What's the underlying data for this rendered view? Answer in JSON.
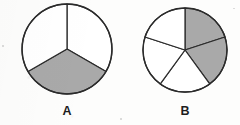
{
  "figure": {
    "title": "",
    "background_color": "#fdfdfc",
    "stroke_color": "#2b2b2b",
    "shaded_color": "#a9a9a9",
    "unshaded_color": "#ffffff",
    "label_color": "#1d1d1d"
  },
  "chart_data": {
    "type": "pie",
    "title": "",
    "xlabel": "",
    "ylabel": "",
    "legend": [],
    "grid": false,
    "charts": [
      {
        "label": "A",
        "total_sectors": 3,
        "shaded_sectors": 1,
        "fraction_shaded": "1/3",
        "sector_angle_degrees": 120,
        "start_angle_degrees": 0,
        "center_x": 67,
        "center_y": 49,
        "radius": 45,
        "categories": [
          "sector 1",
          "sector 2",
          "sector 3"
        ],
        "values": [
          120,
          120,
          120
        ],
        "shaded_flags": [
          false,
          true,
          false
        ]
      },
      {
        "label": "B",
        "total_sectors": 5,
        "shaded_sectors": 2,
        "fraction_shaded": "2/5",
        "sector_angle_degrees": 72,
        "start_angle_degrees": 0,
        "center_x": 185,
        "center_y": 50,
        "radius": 42,
        "categories": [
          "sector 1",
          "sector 2",
          "sector 3",
          "sector 4",
          "sector 5"
        ],
        "values": [
          72,
          72,
          72,
          72,
          72
        ],
        "shaded_flags": [
          true,
          true,
          false,
          false,
          false
        ]
      }
    ]
  },
  "labels": {
    "a": "A",
    "b": "B"
  }
}
